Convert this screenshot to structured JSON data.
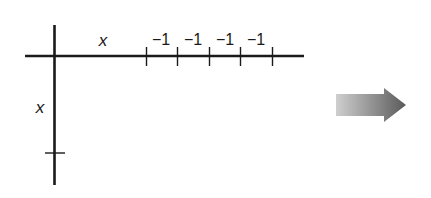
{
  "diagram": {
    "row_header_label": "x",
    "column_header_label": "x",
    "column_values": [
      "−1",
      "−1",
      "−1",
      "−1"
    ],
    "arrow": {
      "direction": "right",
      "color_start": "#c8c8c8",
      "color_end": "#555555"
    },
    "line_color": "#1a1a1a"
  }
}
